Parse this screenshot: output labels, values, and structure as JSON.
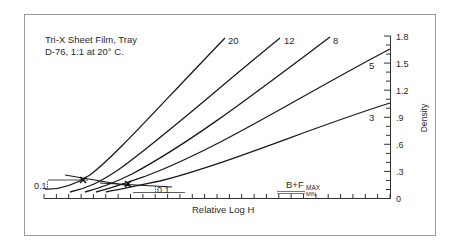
{
  "chart_data": {
    "type": "line",
    "title": "Tri-X Sheet Film, Tray",
    "subtitle": "D-76, 1:1 at 20° C.",
    "xlabel": "Relative Log H",
    "ylabel": "Density",
    "ylim": [
      0,
      1.8
    ],
    "y_ticks": [
      "0",
      ".3",
      ".6",
      ".9",
      "1.2",
      "1.5",
      "1.8"
    ],
    "y_tick_values": [
      0,
      0.3,
      0.6,
      0.9,
      1.2,
      1.5,
      1.8
    ],
    "x_minor_ticks": 28,
    "grid": false,
    "legend_position": "inline curve labels (development time, minutes)",
    "series": [
      {
        "name": "20",
        "label": "20",
        "points": [
          [
            0.0,
            0.1
          ],
          [
            0.12,
            0.13
          ],
          [
            0.22,
            0.22
          ],
          [
            0.32,
            0.38
          ],
          [
            0.42,
            0.62
          ],
          [
            0.52,
            0.92
          ],
          [
            0.62,
            1.25
          ],
          [
            0.72,
            1.58
          ],
          [
            0.78,
            1.78
          ]
        ]
      },
      {
        "name": "12",
        "label": "12",
        "points": [
          [
            0.07,
            0.07
          ],
          [
            0.17,
            0.13
          ],
          [
            0.27,
            0.27
          ],
          [
            0.4,
            0.52
          ],
          [
            0.55,
            0.88
          ],
          [
            0.7,
            1.26
          ],
          [
            0.86,
            1.62
          ],
          [
            0.94,
            1.78
          ]
        ]
      },
      {
        "name": "8",
        "label": "8",
        "points": [
          [
            0.14,
            0.06
          ],
          [
            0.24,
            0.12
          ],
          [
            0.36,
            0.27
          ],
          [
            0.52,
            0.55
          ],
          [
            0.7,
            0.88
          ],
          [
            0.88,
            1.22
          ],
          [
            1.06,
            1.55
          ],
          [
            1.18,
            1.78
          ]
        ]
      },
      {
        "name": "5",
        "label": "5",
        "points": [
          [
            0.21,
            0.06
          ],
          [
            0.32,
            0.12
          ],
          [
            0.46,
            0.25
          ],
          [
            0.66,
            0.49
          ],
          [
            0.88,
            0.78
          ],
          [
            1.1,
            1.06
          ],
          [
            1.32,
            1.35
          ],
          [
            1.52,
            1.65
          ]
        ]
      },
      {
        "name": "3",
        "label": "3",
        "points": [
          [
            0.28,
            0.06
          ],
          [
            0.4,
            0.12
          ],
          [
            0.56,
            0.22
          ],
          [
            0.76,
            0.37
          ],
          [
            0.98,
            0.55
          ],
          [
            1.2,
            0.74
          ],
          [
            1.4,
            0.9
          ],
          [
            1.52,
            1.05
          ]
        ]
      }
    ],
    "annotations": [
      {
        "text": "0.1",
        "meaning": "density 0.1 above base + fog (left bracket)"
      },
      {
        "text": "0.1",
        "meaning": "density 0.1 above base + fog (right bracket)"
      },
      {
        "text": "B+F",
        "sub_max": "MAX",
        "sub_min": "MIN",
        "meaning": "base plus fog range"
      },
      {
        "text": "x",
        "meaning": "speed point markers at density 0.1 above B+F"
      }
    ]
  },
  "labels": {
    "title_line1": "Tri-X Sheet Film, Tray",
    "title_line2": "D-76, 1:1 at 20° C.",
    "xlabel": "Relative Log H",
    "ylabel": "Density",
    "bf_main": "B+F",
    "bf_max": "MAX",
    "bf_min": "MIN",
    "left_bracket": "0.1",
    "right_bracket": "0.1",
    "curve_20": "20",
    "curve_12": "12",
    "curve_8": "8",
    "curve_5": "5",
    "curve_3": "3",
    "y0": "0",
    "y1": ".3",
    "y2": ".6",
    "y3": ".9",
    "y4": "1.2",
    "y5": "1.5",
    "y6": "1.8"
  }
}
